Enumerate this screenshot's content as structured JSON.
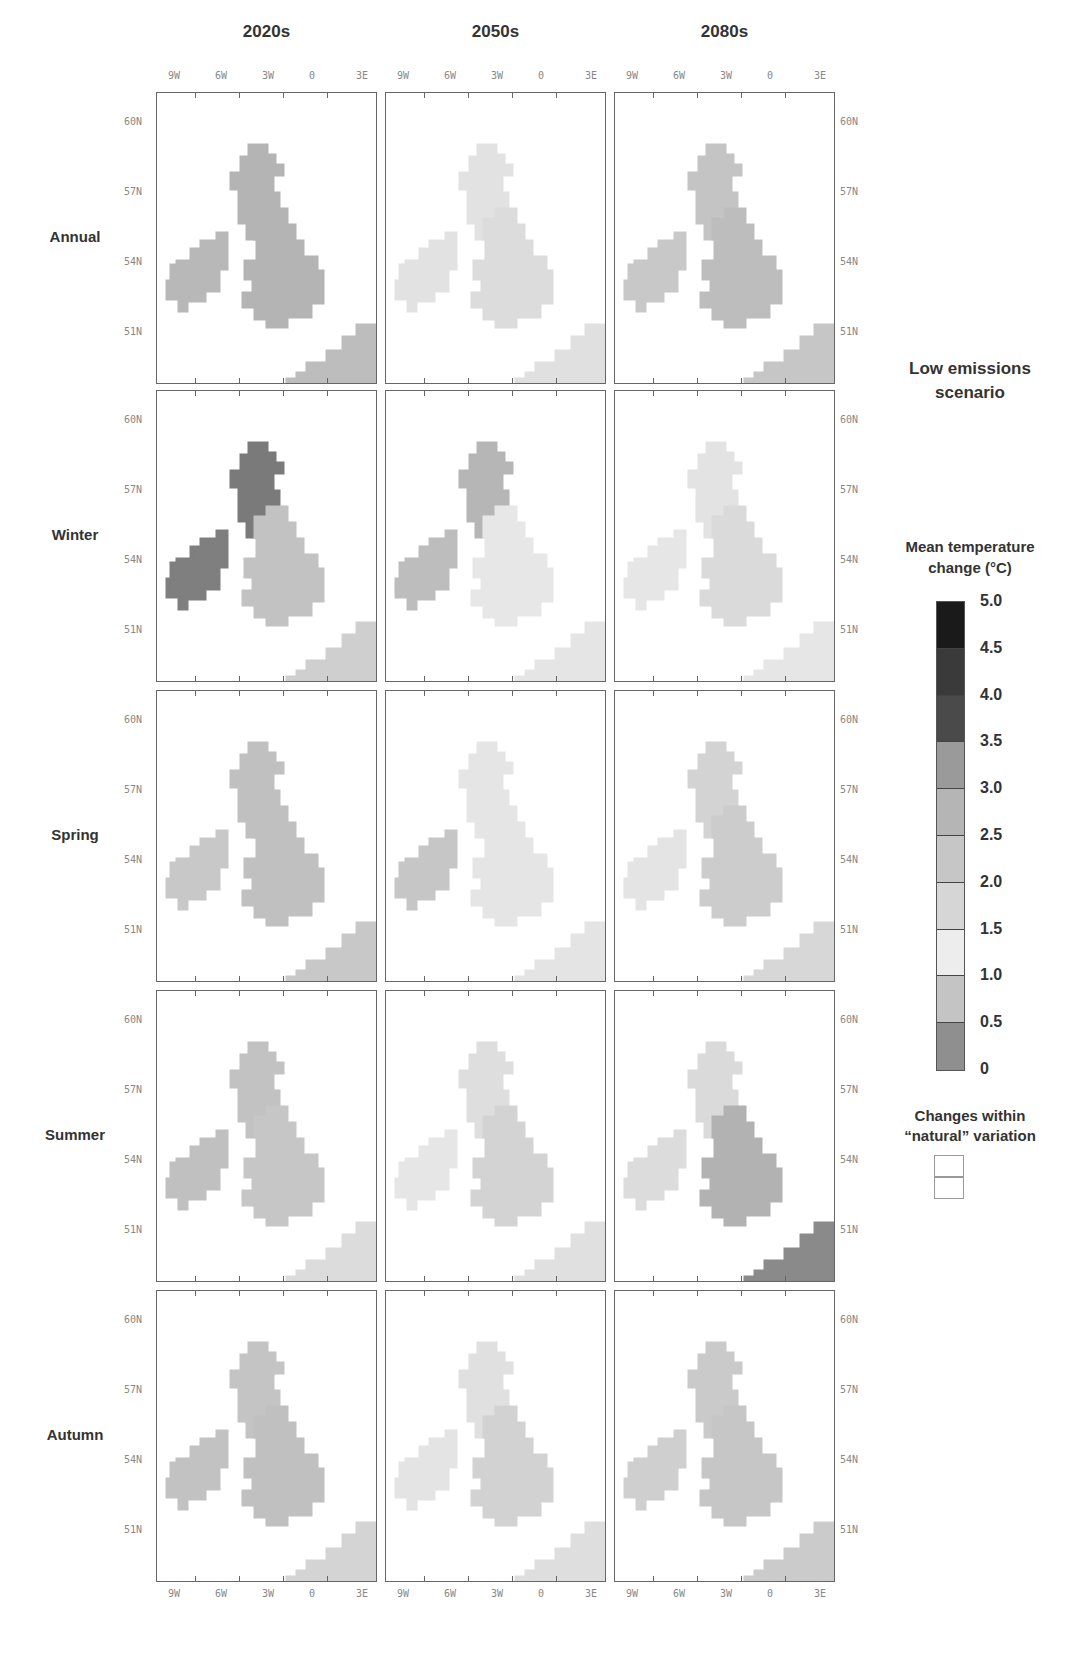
{
  "columns": [
    "2020s",
    "2050s",
    "2080s"
  ],
  "rows": [
    "Annual",
    "Winter",
    "Spring",
    "Summer",
    "Autumn"
  ],
  "x_ticks": [
    "9W",
    "6W",
    "3W",
    "0",
    "3E"
  ],
  "y_ticks": [
    "60N",
    "57N",
    "54N",
    "51N"
  ],
  "legend": {
    "scenario_title_line1": "Low emissions",
    "scenario_title_line2": "scenario",
    "scale_title_line1": "Mean temperature",
    "scale_title_line2": "change (°C)",
    "scale_labels": [
      "5.0",
      "4.5",
      "4.0",
      "3.5",
      "3.0",
      "2.5",
      "2.0",
      "1.5",
      "1.0",
      "0.5",
      "0"
    ],
    "scale_colors": [
      "#1a1a1a",
      "#3a3a3a",
      "#4a4a4a",
      "#9a9a9a",
      "#b5b5b5",
      "#c6c6c6",
      "#d6d6d6",
      "#ededed",
      "#c4c4c4",
      "#8f8f8f"
    ],
    "natural_title_line1": "Changes within",
    "natural_title_line2": "“natural” variation"
  },
  "chart_data": {
    "type": "heatmap",
    "subplot_columns": [
      "2020s",
      "2050s",
      "2080s"
    ],
    "subplot_rows": [
      "Annual",
      "Winter",
      "Spring",
      "Summer",
      "Autumn"
    ],
    "x_axis_ticks": [
      "9W",
      "6W",
      "3W",
      "0",
      "3E"
    ],
    "y_axis_ticks": [
      "60N",
      "57N",
      "54N",
      "51N"
    ],
    "colorbar": {
      "min": 0,
      "max": 5.0,
      "step": 0.5,
      "label": "Mean temperature change (°C)"
    },
    "approx_values": {
      "Annual": {
        "2020s": [
          2.5,
          3.0
        ],
        "2050s": [
          1.0,
          1.5
        ],
        "2080s": [
          1.5,
          2.5
        ]
      },
      "Winter": {
        "2020s": [
          2.5,
          3.5
        ],
        "2050s": [
          1.0,
          2.5
        ],
        "2080s": [
          1.0,
          2.0
        ]
      },
      "Spring": {
        "2020s": [
          2.0,
          3.0
        ],
        "2050s": [
          1.0,
          2.5
        ],
        "2080s": [
          1.0,
          2.0
        ]
      },
      "Summer": {
        "2020s": [
          1.0,
          3.5
        ],
        "2050s": [
          1.0,
          2.5
        ],
        "2080s": [
          1.0,
          4.5
        ]
      },
      "Autumn": {
        "2020s": [
          1.5,
          3.0
        ],
        "2050s": [
          1.0,
          2.5
        ],
        "2080s": [
          1.5,
          3.0
        ]
      }
    },
    "legend_position": "right"
  }
}
